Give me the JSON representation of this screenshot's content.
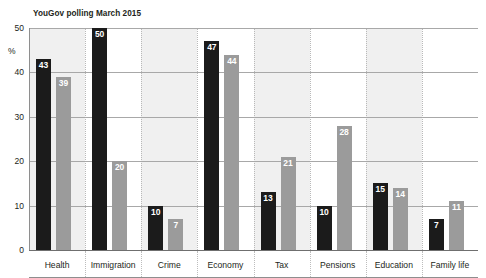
{
  "header": {
    "title": "What mattered to the voters before the election",
    "subtitle": "YouGov polling March 2015"
  },
  "chart_data": {
    "type": "bar",
    "title": "What mattered to the voters before the election",
    "subtitle": "YouGov polling March 2015",
    "xlabel": "",
    "ylabel": "%",
    "ylim": [
      0,
      50
    ],
    "yticks": [
      0,
      10,
      20,
      30,
      40,
      50
    ],
    "grid": true,
    "legend": "none",
    "categories": [
      "Health",
      "Immigration",
      "Crime",
      "Economy",
      "Tax",
      "Pensions",
      "Education",
      "Family life"
    ],
    "series": [
      {
        "name": "dark",
        "color": "#1b1b1b",
        "values": [
          43,
          50,
          10,
          47,
          13,
          10,
          15,
          7
        ]
      },
      {
        "name": "grey",
        "color": "#9b9b9b",
        "values": [
          39,
          20,
          7,
          44,
          21,
          28,
          14,
          11
        ]
      }
    ]
  },
  "colors": {
    "dark_bar": "#1b1b1b",
    "grey_bar": "#9b9b9b",
    "band_shaded": "#f0f0f0",
    "band_plain": "#ffffff",
    "gridline": "#a8a8a8",
    "text": "#231f20"
  }
}
